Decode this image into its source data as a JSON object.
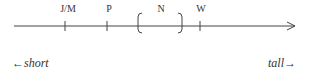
{
  "diagram": {
    "type": "ordinal-scale",
    "axis": {
      "direction": "left-to-right",
      "arrow_end": true
    },
    "markers": [
      {
        "label": "J/M",
        "kind": "tick"
      },
      {
        "label": "P",
        "kind": "tick"
      },
      {
        "label": "N",
        "kind": "range-bracket"
      },
      {
        "label": "W",
        "kind": "tick"
      }
    ],
    "left_end_label": "←short",
    "right_end_label": "tall→"
  }
}
